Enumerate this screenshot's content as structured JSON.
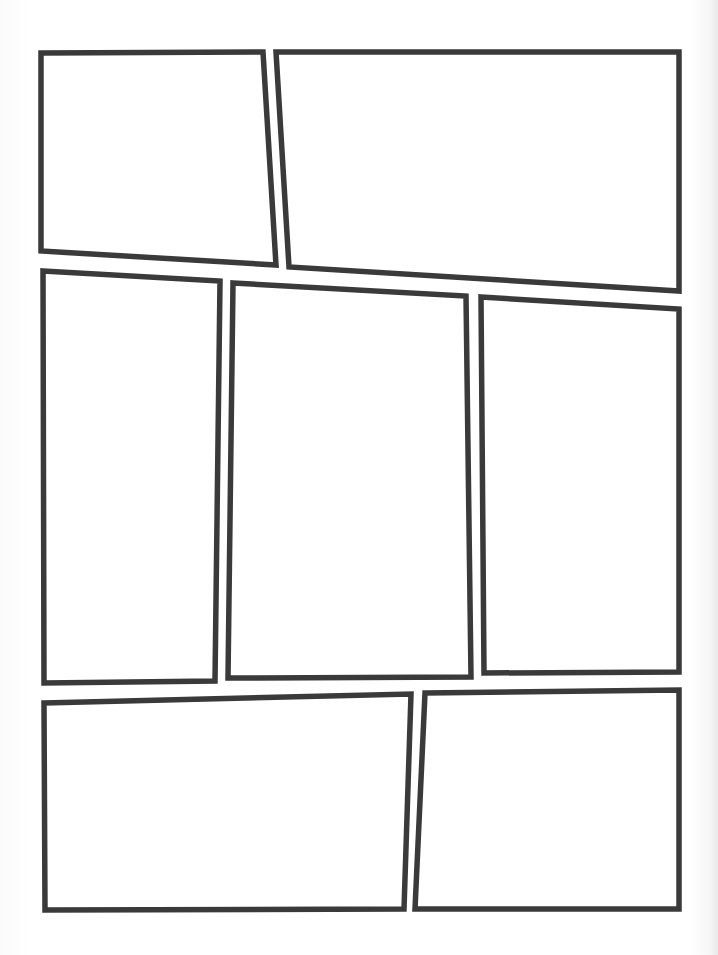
{
  "page": {
    "type": "comic-page-template",
    "width": 718,
    "height": 955,
    "background": "#ffffff",
    "border_color": "#3a3a3a",
    "border_width": 5.5
  },
  "panels": [
    {
      "id": "panel-1",
      "row": 1,
      "points": [
        [
          41,
          53
        ],
        [
          263,
          52
        ],
        [
          276,
          265
        ],
        [
          41,
          251
        ]
      ]
    },
    {
      "id": "panel-2",
      "row": 1,
      "points": [
        [
          276,
          52
        ],
        [
          679,
          52
        ],
        [
          679,
          291
        ],
        [
          289,
          267
        ]
      ]
    },
    {
      "id": "panel-3",
      "row": 2,
      "points": [
        [
          43,
          271
        ],
        [
          220,
          281
        ],
        [
          215,
          681
        ],
        [
          44,
          683
        ]
      ]
    },
    {
      "id": "panel-4",
      "row": 2,
      "points": [
        [
          233,
          283
        ],
        [
          466,
          296
        ],
        [
          471,
          677
        ],
        [
          228,
          678
        ]
      ]
    },
    {
      "id": "panel-5",
      "row": 2,
      "points": [
        [
          481,
          297
        ],
        [
          679,
          309
        ],
        [
          679,
          672
        ],
        [
          484,
          673
        ]
      ]
    },
    {
      "id": "panel-6",
      "row": 3,
      "points": [
        [
          44,
          703
        ],
        [
          411,
          694
        ],
        [
          404,
          909
        ],
        [
          45,
          910
        ]
      ]
    },
    {
      "id": "panel-7",
      "row": 3,
      "points": [
        [
          425,
          693
        ],
        [
          679,
          690
        ],
        [
          679,
          909
        ],
        [
          415,
          909
        ]
      ]
    }
  ]
}
